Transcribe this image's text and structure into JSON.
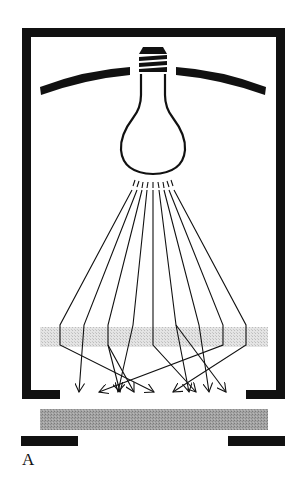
{
  "figure": {
    "panel_label": "A"
  },
  "colors": {
    "ink": "#111111",
    "diffuser": "#d6d6d6",
    "sample": "#9a9a9a",
    "background": "#ffffff"
  },
  "geometry": {
    "ray_count": 9,
    "rays": [
      {
        "start": [
          131,
          180
        ],
        "bend": [
          60,
          340
        ],
        "end": [
          150,
          392
        ]
      },
      {
        "start": [
          136,
          180
        ],
        "bend": [
          84,
          340
        ],
        "end": [
          79,
          392
        ]
      },
      {
        "start": [
          141,
          180
        ],
        "bend": [
          107,
          340
        ],
        "end": [
          134,
          392
        ]
      },
      {
        "start": [
          146,
          180
        ],
        "bend": [
          131,
          340
        ],
        "end": [
          117,
          392
        ]
      },
      {
        "start": [
          152,
          180
        ],
        "bend": [
          152,
          340
        ],
        "end": [
          208,
          392
        ]
      },
      {
        "start": [
          158,
          180
        ],
        "bend": [
          175,
          340
        ],
        "end": [
          188,
          392
        ]
      },
      {
        "start": [
          163,
          180
        ],
        "bend": [
          199,
          340
        ],
        "end": [
          208,
          392
        ]
      },
      {
        "start": [
          169,
          180
        ],
        "bend": [
          222,
          340
        ],
        "end": [
          100,
          392
        ]
      },
      {
        "start": [
          174,
          180
        ],
        "bend": [
          246,
          340
        ],
        "end": [
          173,
          392
        ]
      }
    ]
  }
}
